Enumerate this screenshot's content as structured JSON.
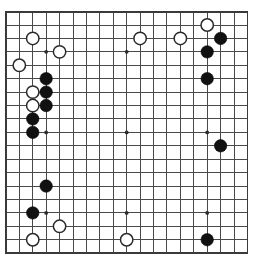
{
  "board": {
    "title": "Go board position",
    "size": 19,
    "origin_x": 5.9,
    "origin_y": 11.6,
    "spacing": 13.42,
    "stone_radius": 6.2,
    "star_radius": 1.9,
    "colors": {
      "background": "#ffffff",
      "grid": "#4a4a4a",
      "border": "#3a3a3a",
      "black_stone": "#111111",
      "white_stone": "#ffffff",
      "white_stone_outline": "#2a2a2a",
      "star_point": "#2b2b2b"
    },
    "star_points": [
      {
        "col": 3,
        "row": 3
      },
      {
        "col": 9,
        "row": 3
      },
      {
        "col": 15,
        "row": 3
      },
      {
        "col": 3,
        "row": 9
      },
      {
        "col": 9,
        "row": 9
      },
      {
        "col": 15,
        "row": 9
      },
      {
        "col": 3,
        "row": 15
      },
      {
        "col": 9,
        "row": 15
      },
      {
        "col": 15,
        "row": 15
      }
    ],
    "stones": [
      {
        "col": 15,
        "row": 1,
        "color": "white"
      },
      {
        "col": 2,
        "row": 2,
        "color": "white"
      },
      {
        "col": 10,
        "row": 2,
        "color": "white"
      },
      {
        "col": 13,
        "row": 2,
        "color": "white"
      },
      {
        "col": 16,
        "row": 2,
        "color": "black"
      },
      {
        "col": 4,
        "row": 3,
        "color": "white"
      },
      {
        "col": 15,
        "row": 3,
        "color": "black"
      },
      {
        "col": 1,
        "row": 4,
        "color": "white"
      },
      {
        "col": 3,
        "row": 5,
        "color": "black"
      },
      {
        "col": 15,
        "row": 5,
        "color": "black"
      },
      {
        "col": 2,
        "row": 6,
        "color": "white"
      },
      {
        "col": 3,
        "row": 6,
        "color": "black"
      },
      {
        "col": 2,
        "row": 7,
        "color": "white"
      },
      {
        "col": 3,
        "row": 7,
        "color": "black"
      },
      {
        "col": 2,
        "row": 8,
        "color": "black"
      },
      {
        "col": 2,
        "row": 9,
        "color": "black"
      },
      {
        "col": 16,
        "row": 10,
        "color": "black"
      },
      {
        "col": 3,
        "row": 13,
        "color": "black"
      },
      {
        "col": 2,
        "row": 15,
        "color": "black"
      },
      {
        "col": 4,
        "row": 16,
        "color": "white"
      },
      {
        "col": 2,
        "row": 17,
        "color": "white"
      },
      {
        "col": 9,
        "row": 17,
        "color": "white"
      },
      {
        "col": 15,
        "row": 17,
        "color": "black"
      }
    ]
  }
}
